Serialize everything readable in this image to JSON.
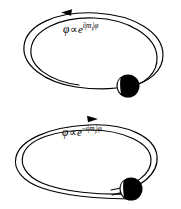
{
  "figure": {
    "background_color": "#ffffff",
    "stroke_color": "#000000",
    "width": 181,
    "height": 209
  },
  "panels": [
    {
      "id": "top",
      "name": "positive-m-orbit",
      "arrow_direction": "counterclockwise",
      "arrow_label": "leftward-arrow",
      "particle_label": "electron-sphere",
      "formula": {
        "wavefunction": "φ",
        "relation": "∝",
        "base": "e",
        "exponent_sign": "",
        "exponent_i": "i",
        "exponent_bar_open": "|",
        "exponent_m": "m",
        "exponent_sub": "l",
        "exponent_bar_close": "|",
        "exponent_phi": "φ",
        "plain": "φ ∝ e^{i|m_l|φ}"
      }
    },
    {
      "id": "bottom",
      "name": "negative-m-orbit",
      "arrow_direction": "clockwise",
      "arrow_label": "rightward-arrow",
      "particle_label": "electron-sphere",
      "formula": {
        "wavefunction": "φ",
        "relation": "∝",
        "base": "e",
        "exponent_sign": "−",
        "exponent_i": "i",
        "exponent_bar_open": "|",
        "exponent_m": "m",
        "exponent_sub": "l",
        "exponent_bar_close": "|",
        "exponent_phi": "φ",
        "plain": "φ ∝ e^{−i|m_l|φ}"
      }
    }
  ]
}
